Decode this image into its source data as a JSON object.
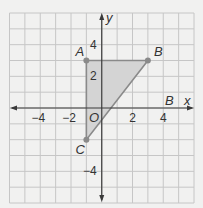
{
  "figure": {
    "type": "coordinate-plane",
    "grid": {
      "x_min": -6,
      "x_max": 6,
      "y_min": -6,
      "y_max": 6,
      "step": 1
    },
    "axes": {
      "x_label": "x",
      "y_label": "y",
      "origin_label": "O",
      "x_ticks": [
        {
          "value": -4,
          "label": "−4"
        },
        {
          "value": -2,
          "label": "−2"
        },
        {
          "value": 2,
          "label": "2"
        },
        {
          "value": 4,
          "label": "4"
        }
      ],
      "y_ticks": [
        {
          "value": 4,
          "label": "4"
        },
        {
          "value": 2,
          "label": "2"
        },
        {
          "value": -4,
          "label": "−4"
        }
      ]
    },
    "triangle": {
      "vertices": [
        {
          "name": "A",
          "x": -1,
          "y": 3
        },
        {
          "name": "B",
          "x": 3,
          "y": 3
        },
        {
          "name": "C",
          "x": -1,
          "y": -2
        }
      ],
      "fill_color": "#d4d4d4",
      "edge_color": "#8a8a8a"
    },
    "extra_labels": [
      {
        "text": "B",
        "note": "label near positive x-axis"
      }
    ],
    "colors": {
      "background": "#f1f1f0",
      "grid": "#c6c6c6",
      "axis": "#3a3a3a",
      "point": "#8a8a8a"
    }
  }
}
